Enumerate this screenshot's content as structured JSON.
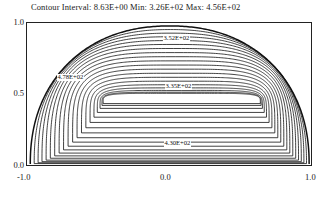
{
  "header": {
    "text": "Contour Interval: 8.63E+00  Min: 3.26E+02 Max: 4.56E+02",
    "interval_label": "Contour Interval:",
    "interval_value": "8.63E+00",
    "min_label": "Min:",
    "min_value": "3.26E+02",
    "max_label": "Max:",
    "max_value": "4.56E+02"
  },
  "axes": {
    "x_ticks": [
      "-1.0",
      "0.0",
      "1.0"
    ],
    "y_ticks": [
      "1.0",
      "0.5",
      "0.0"
    ]
  },
  "chart_data": {
    "type": "line",
    "title": "Contour Interval: 8.63E+00  Min: 3.26E+02 Max: 4.56E+02",
    "xlabel": "",
    "ylabel": "",
    "xlim": [
      -1.0,
      1.0
    ],
    "ylim": [
      0.0,
      1.0
    ],
    "grid": false,
    "legend": "none",
    "contour_interval": 8.63,
    "min": 326.0,
    "max": 456.0,
    "x_ticks": [
      -1.0,
      0.0,
      1.0
    ],
    "y_ticks": [
      0.0,
      0.5,
      1.0
    ],
    "labels": [
      {
        "text": "3.52E+02",
        "x": 0.12,
        "y": 0.88,
        "value": 352.0
      },
      {
        "text": "3.35E+02",
        "x": 0.13,
        "y": 0.545,
        "value": 335.0
      },
      {
        "text": "4.78E+02",
        "x": -0.52,
        "y": 0.49,
        "value": 478.0
      },
      {
        "text": "4.30E+02",
        "x": 0.13,
        "y": 0.105,
        "value": 430.0
      }
    ],
    "levels": [
      335,
      343,
      352,
      361,
      369,
      378,
      387,
      395,
      404,
      413,
      421,
      430,
      438,
      447,
      456
    ],
    "series": [
      {
        "name": "contour-1",
        "t": 0.055
      },
      {
        "name": "contour-2",
        "t": 0.105
      },
      {
        "name": "contour-3",
        "t": 0.155
      },
      {
        "name": "contour-4",
        "t": 0.205
      },
      {
        "name": "contour-5",
        "t": 0.258
      },
      {
        "name": "contour-6",
        "t": 0.312
      },
      {
        "name": "contour-7",
        "t": 0.368
      },
      {
        "name": "contour-8",
        "t": 0.425
      },
      {
        "name": "contour-9",
        "t": 0.482
      },
      {
        "name": "contour-10",
        "t": 0.54
      },
      {
        "name": "contour-11",
        "t": 0.598
      },
      {
        "name": "contour-12",
        "t": 0.655
      },
      {
        "name": "contour-13",
        "t": 0.712
      },
      {
        "name": "contour-14",
        "t": 0.768
      },
      {
        "name": "contour-15",
        "t": 0.822
      },
      {
        "name": "contour-16",
        "t": 0.872
      },
      {
        "name": "contour-17",
        "t": 0.915
      },
      {
        "name": "contour-18",
        "t": 0.95
      },
      {
        "name": "contour-19",
        "t": 0.975
      },
      {
        "name": "contour-20",
        "t": 0.99
      }
    ]
  }
}
